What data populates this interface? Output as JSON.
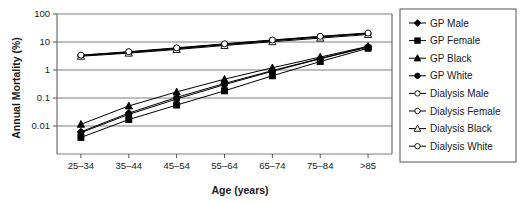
{
  "chart_data": {
    "type": "line",
    "title": "",
    "xlabel": "Age (years)",
    "ylabel": "Annual Mortality (%)",
    "categories": [
      "25–34",
      "35–44",
      "45–54",
      "55–64",
      "65–74",
      "75–84",
      ">85"
    ],
    "yticks": [
      "0.01",
      "0.1",
      "1",
      "10",
      "100"
    ],
    "ytick_values": [
      0.01,
      0.1,
      1,
      10,
      100
    ],
    "ylim": [
      0.001,
      100
    ],
    "yscale": "log",
    "grid": true,
    "legend_position": "right",
    "series": [
      {
        "name": "GP Male",
        "marker": "diamond",
        "filled": true,
        "values": [
          0.0062,
          0.029,
          0.105,
          0.33,
          0.95,
          2.6,
          6.8
        ]
      },
      {
        "name": "GP Female",
        "marker": "square",
        "filled": true,
        "values": [
          0.0039,
          0.017,
          0.056,
          0.18,
          0.62,
          2.0,
          6.0
        ]
      },
      {
        "name": "GP Black",
        "marker": "triangle",
        "filled": true,
        "values": [
          0.0115,
          0.052,
          0.165,
          0.47,
          1.2,
          2.9,
          7.0
        ]
      },
      {
        "name": "GP White",
        "marker": "circle",
        "filled": true,
        "values": [
          0.0058,
          0.026,
          0.092,
          0.3,
          0.9,
          2.5,
          6.6
        ]
      },
      {
        "name": "Dialysis Male",
        "marker": "circle",
        "filled": false,
        "values": [
          3.3,
          4.4,
          6.0,
          8.4,
          11.5,
          15.5,
          20.5
        ]
      },
      {
        "name": "Dialysis Female",
        "marker": "circle",
        "filled": false,
        "values": [
          3.2,
          4.2,
          5.7,
          8.0,
          11.0,
          15.0,
          20.0
        ]
      },
      {
        "name": "Dialysis Black",
        "marker": "triangle",
        "filled": false,
        "values": [
          3.1,
          4.0,
          5.4,
          7.5,
          10.2,
          13.8,
          18.5
        ]
      },
      {
        "name": "Dialysis White",
        "marker": "circle",
        "filled": false,
        "values": [
          3.4,
          4.5,
          6.2,
          8.6,
          11.8,
          16.0,
          21.0
        ]
      }
    ]
  },
  "axes": {
    "ylabel": "Annual Mortality (%)",
    "xlabel": "Age (years)",
    "ytick_labels": [
      "100",
      "10",
      "1",
      "0.1",
      "0.01"
    ],
    "xtick_labels": [
      "25–34",
      "35–44",
      "45–54",
      "55–64",
      "65–74",
      "75–84",
      ">85"
    ]
  },
  "legend": {
    "items": [
      {
        "label": "GP Male"
      },
      {
        "label": "GP Female"
      },
      {
        "label": "GP Black"
      },
      {
        "label": "GP White"
      },
      {
        "label": "Dialysis Male"
      },
      {
        "label": "Dialysis Female"
      },
      {
        "label": "Dialysis Black"
      },
      {
        "label": "Dialysis White"
      }
    ]
  },
  "colors": {
    "line": "#000000",
    "grid": "#808080",
    "frame": "#555555",
    "text": "#1a1a1a",
    "background": "#ffffff"
  }
}
